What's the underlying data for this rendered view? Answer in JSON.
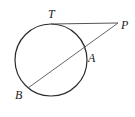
{
  "diagram": {
    "type": "geometry",
    "circle": {
      "cx": 51,
      "cy": 60,
      "r": 36
    },
    "points": {
      "T": {
        "label": "T",
        "x": 51,
        "y": 24
      },
      "P": {
        "label": "P",
        "x": 118,
        "y": 23
      },
      "A": {
        "label": "A",
        "x": 85,
        "y": 47
      },
      "B": {
        "label": "B",
        "x": 28,
        "y": 88
      }
    },
    "segments": [
      {
        "from": "T",
        "to": "P",
        "kind": "tangent"
      },
      {
        "from": "P",
        "to": "B",
        "kind": "secant"
      }
    ],
    "colors": {
      "circle": "#2b2b2b",
      "lines": "#555555",
      "labels": "#222222"
    }
  }
}
